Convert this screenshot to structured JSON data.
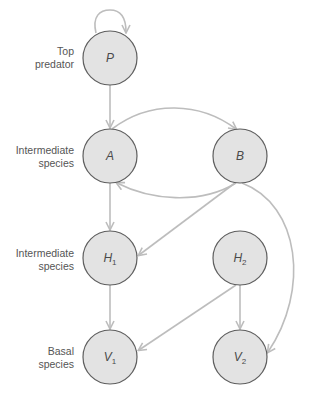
{
  "colors": {
    "node_fill": "#e3e3e3",
    "node_stroke": "#5e5e5e",
    "arrow": "#bdbdbd",
    "label_text": "#555555"
  },
  "row_labels": [
    {
      "line1": "Top",
      "line2": "predator"
    },
    {
      "line1": "Intermediate",
      "line2": "species"
    },
    {
      "line1": "Intermediate",
      "line2": "species"
    },
    {
      "line1": "Basal",
      "line2": "species"
    }
  ],
  "nodes": [
    {
      "id": "P",
      "letter": "P",
      "sub": "",
      "x": 110,
      "y": 58,
      "level": "Top predator"
    },
    {
      "id": "A",
      "letter": "A",
      "sub": "",
      "x": 110,
      "y": 156,
      "level": "Intermediate species"
    },
    {
      "id": "B",
      "letter": "B",
      "sub": "",
      "x": 240,
      "y": 156,
      "level": "Intermediate species"
    },
    {
      "id": "H1",
      "letter": "H",
      "sub": "1",
      "x": 110,
      "y": 258,
      "level": "Intermediate species"
    },
    {
      "id": "H2",
      "letter": "H",
      "sub": "2",
      "x": 240,
      "y": 258,
      "level": "Intermediate species"
    },
    {
      "id": "V1",
      "letter": "V",
      "sub": "1",
      "x": 110,
      "y": 357,
      "level": "Basal species"
    },
    {
      "id": "V2",
      "letter": "V",
      "sub": "2",
      "x": 240,
      "y": 357,
      "level": "Basal species"
    }
  ],
  "edges": [
    {
      "from": "P",
      "to": "P",
      "type": "self-loop"
    },
    {
      "from": "P",
      "to": "A"
    },
    {
      "from": "A",
      "to": "B"
    },
    {
      "from": "B",
      "to": "A"
    },
    {
      "from": "A",
      "to": "H1"
    },
    {
      "from": "B",
      "to": "H1"
    },
    {
      "from": "B",
      "to": "V2"
    },
    {
      "from": "H1",
      "to": "V1"
    },
    {
      "from": "H2",
      "to": "V1"
    },
    {
      "from": "H2",
      "to": "V2"
    }
  ]
}
